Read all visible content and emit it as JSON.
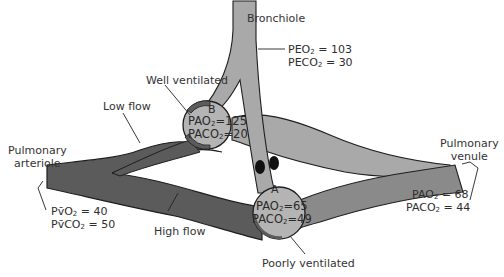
{
  "diagram": {
    "labels": {
      "bronchiole": "Bronchiole",
      "well_ventilated": "Well ventilated",
      "low_flow": "Low flow",
      "pulmonary_arteriole": [
        "Pulmonary",
        "arteriole"
      ],
      "pulmonary_venule": [
        "Pulmonary",
        "venule"
      ],
      "high_flow": "High flow",
      "poorly_ventilated": "Poorly ventilated",
      "alveolus_b": "B",
      "alveolus_a": "A"
    },
    "bronchiole_values": {
      "po2": {
        "label": "PEO",
        "sub": "2",
        "eq": " = ",
        "value": "103"
      },
      "pco2": {
        "label": "PECO",
        "sub": "2",
        "eq": " = ",
        "value": "30"
      }
    },
    "alveolus_b_values": {
      "po2": {
        "label": "PAO",
        "sub": "2",
        "eq": " = ",
        "value": "125"
      },
      "pco2": {
        "label": "PACO",
        "sub": "2",
        "eq": " = ",
        "value": "20"
      }
    },
    "alveolus_a_values": {
      "po2": {
        "label": "PAO",
        "sub": "2",
        "eq": " = ",
        "value": "65"
      },
      "pco2": {
        "label": "PACO",
        "sub": "2",
        "eq": " = ",
        "value": "49"
      }
    },
    "arteriole_values": {
      "po2": {
        "label": "Pv̄O",
        "sub": "2",
        "eq": " = ",
        "value": "40"
      },
      "pco2": {
        "label": "Pv̄CO",
        "sub": "2",
        "eq": " = ",
        "value": "50"
      }
    },
    "venule_values": {
      "po2": {
        "label": "PAO",
        "sub": "2",
        "eq": " = ",
        "value": "68"
      },
      "pco2": {
        "label": "PACO",
        "sub": "2",
        "eq": " = ",
        "value": "44"
      }
    },
    "colors": {
      "dark_vessel": "#5b5b5b",
      "light_vessel": "#a9a9a9",
      "alveolus_fill": "#b4b4b4",
      "outline": "#1e1e1e",
      "background": "#ffffff"
    }
  }
}
